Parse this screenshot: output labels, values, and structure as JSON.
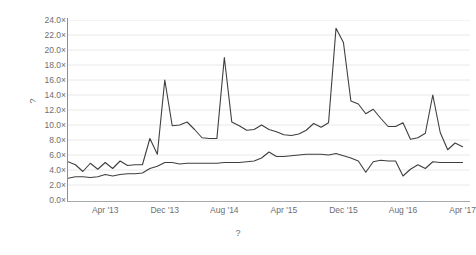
{
  "axes": {
    "y_title": "?",
    "x_title": "?",
    "y_ticks": [
      "0.0×",
      "2.0×",
      "4.0×",
      "6.0×",
      "8.0×",
      "10.0×",
      "12.0×",
      "14.0×",
      "16.0×",
      "18.0×",
      "20.0×",
      "22.0×",
      "24.0×"
    ],
    "x_ticks": [
      "Apr '13",
      "Dec '13",
      "Aug '14",
      "Apr '15",
      "Dec '15",
      "Aug '16",
      "Apr '17"
    ]
  },
  "style": {
    "series_color": "#3f3f41",
    "gridline_color": "#e8e8e9",
    "axis_color": "#8d8e90",
    "text_color": "#6d6e70",
    "background": "#ffffff"
  },
  "chart_data": {
    "type": "line",
    "title": "",
    "subtitle": "",
    "xlabel": "?",
    "ylabel": "?",
    "ylim": [
      0.0,
      24.0
    ],
    "ytick_values": [
      0.0,
      2.0,
      4.0,
      6.0,
      8.0,
      10.0,
      12.0,
      14.0,
      16.0,
      18.0,
      20.0,
      22.0,
      24.0
    ],
    "ytick_labels": [
      "0.0×",
      "2.0×",
      "4.0×",
      "6.0×",
      "8.0×",
      "10.0×",
      "12.0×",
      "14.0×",
      "16.0×",
      "18.0×",
      "20.0×",
      "22.0×",
      "24.0×"
    ],
    "xtick_labels": [
      "Apr '13",
      "Dec '13",
      "Aug '14",
      "Apr '15",
      "Dec '15",
      "Aug '16",
      "Apr '17"
    ],
    "xtick_x": [
      "2013-04",
      "2013-12",
      "2014-08",
      "2015-04",
      "2015-12",
      "2016-08",
      "2017-04"
    ],
    "xlim": [
      "2012-11",
      "2017-05"
    ],
    "grid": "horizontal",
    "legend": "none",
    "x": [
      "2012-11",
      "2012-12",
      "2013-01",
      "2013-02",
      "2013-03",
      "2013-04",
      "2013-05",
      "2013-06",
      "2013-07",
      "2013-08",
      "2013-09",
      "2013-10",
      "2013-11",
      "2013-12",
      "2014-01",
      "2014-02",
      "2014-03",
      "2014-04",
      "2014-05",
      "2014-06",
      "2014-07",
      "2014-08",
      "2014-09",
      "2014-10",
      "2014-11",
      "2014-12",
      "2015-01",
      "2015-02",
      "2015-03",
      "2015-04",
      "2015-05",
      "2015-06",
      "2015-07",
      "2015-08",
      "2015-09",
      "2015-10",
      "2015-11",
      "2015-12",
      "2016-01",
      "2016-02",
      "2016-03",
      "2016-04",
      "2016-05",
      "2016-06",
      "2016-07",
      "2016-08",
      "2016-09",
      "2016-10",
      "2016-11",
      "2016-12",
      "2017-01",
      "2017-02",
      "2017-03",
      "2017-04"
    ],
    "series": [
      {
        "name": "upper-series",
        "color": "#3f3f41",
        "values": [
          5.1,
          4.7,
          3.8,
          4.9,
          4.1,
          5.0,
          4.2,
          5.2,
          4.6,
          4.7,
          4.7,
          8.2,
          6.1,
          16.0,
          9.9,
          10.0,
          10.4,
          9.4,
          8.3,
          8.2,
          8.2,
          19.0,
          10.4,
          9.9,
          9.3,
          9.4,
          10.0,
          9.4,
          9.1,
          8.7,
          8.6,
          8.8,
          9.3,
          10.2,
          9.7,
          10.3,
          22.9,
          21.0,
          13.2,
          12.8,
          11.5,
          12.1,
          10.9,
          9.8,
          9.8,
          10.3,
          8.1,
          8.3,
          8.9,
          14.0,
          9.0,
          6.7,
          7.6,
          7.1
        ]
      },
      {
        "name": "lower-series",
        "color": "#3f3f41",
        "values": [
          2.9,
          3.1,
          3.1,
          3.0,
          3.1,
          3.4,
          3.2,
          3.4,
          3.5,
          3.5,
          3.6,
          4.2,
          4.5,
          5.0,
          5.0,
          4.8,
          4.9,
          4.9,
          4.9,
          4.9,
          4.9,
          5.0,
          5.0,
          5.0,
          5.1,
          5.2,
          5.6,
          6.4,
          5.8,
          5.8,
          5.9,
          6.0,
          6.1,
          6.1,
          6.1,
          6.0,
          6.2,
          5.9,
          5.6,
          5.2,
          3.7,
          5.1,
          5.3,
          5.2,
          5.2,
          3.2,
          4.1,
          4.7,
          4.2,
          5.1,
          5.0,
          5.0,
          5.0,
          5.0
        ]
      }
    ]
  }
}
